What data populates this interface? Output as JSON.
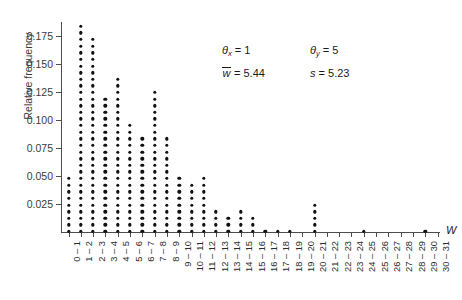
{
  "chart_data": {
    "type": "bar",
    "plot_style": "dot-plot",
    "title": "",
    "xlabel": "W",
    "ylabel": "Relative frequency",
    "ylim": [
      0,
      0.1875
    ],
    "grid": false,
    "dot_unit": 0.0048,
    "ytick_labels": [
      "0.175",
      "0.150",
      "0.125",
      "0.100",
      "0.075",
      "0.050",
      "0.025"
    ],
    "ytick_values": [
      0.175,
      0.15,
      0.125,
      0.1,
      0.075,
      0.05,
      0.025
    ],
    "categories": [
      "0 – 1",
      "1 – 2",
      "2 – 3",
      "3 – 4",
      "4 – 5",
      "5 – 6",
      "6 – 7",
      "7 – 8",
      "8 – 9",
      "9 – 10",
      "10 – 11",
      "11 – 12",
      "12 – 13",
      "13 – 14",
      "14 – 15",
      "15 – 16",
      "16 – 17",
      "17 – 18",
      "18 – 19",
      "19 – 20",
      "20 – 21",
      "21 – 22",
      "22 – 23",
      "23 – 24",
      "24 – 25",
      "25 – 26",
      "26 – 27",
      "27 – 28",
      "28 – 29",
      "29 – 30",
      "30 – 31"
    ],
    "dot_counts": [
      9,
      32,
      30,
      21,
      24,
      17,
      15,
      22,
      15,
      9,
      8,
      9,
      4,
      3,
      4,
      3,
      1,
      1,
      1,
      0,
      5,
      0,
      0,
      0,
      1,
      0,
      0,
      0,
      0,
      1,
      0
    ],
    "values": [
      0.043,
      0.154,
      0.144,
      0.101,
      0.115,
      0.082,
      0.072,
      0.106,
      0.072,
      0.043,
      0.038,
      0.043,
      0.019,
      0.014,
      0.019,
      0.014,
      0.005,
      0.005,
      0.005,
      0.0,
      0.024,
      0.0,
      0.0,
      0.0,
      0.005,
      0.0,
      0.0,
      0.0,
      0.0,
      0.005,
      0.0
    ],
    "annotations": [
      {
        "symbol": "θ",
        "subscript": "x",
        "operator": "=",
        "value": "1"
      },
      {
        "symbol": "θ",
        "subscript": "y",
        "operator": "=",
        "value": "5"
      },
      {
        "symbol": "w",
        "overline": true,
        "operator": "=",
        "value": "5.44"
      },
      {
        "symbol": "s",
        "overline": false,
        "operator": "=",
        "value": "5.23"
      }
    ]
  },
  "axis": {
    "x_name": "W",
    "y_name": "Relative frequency"
  },
  "colors": {
    "dot": "#111111",
    "axis": "#4d4d4d",
    "text": "#1a1a1a",
    "background": "#ffffff"
  }
}
